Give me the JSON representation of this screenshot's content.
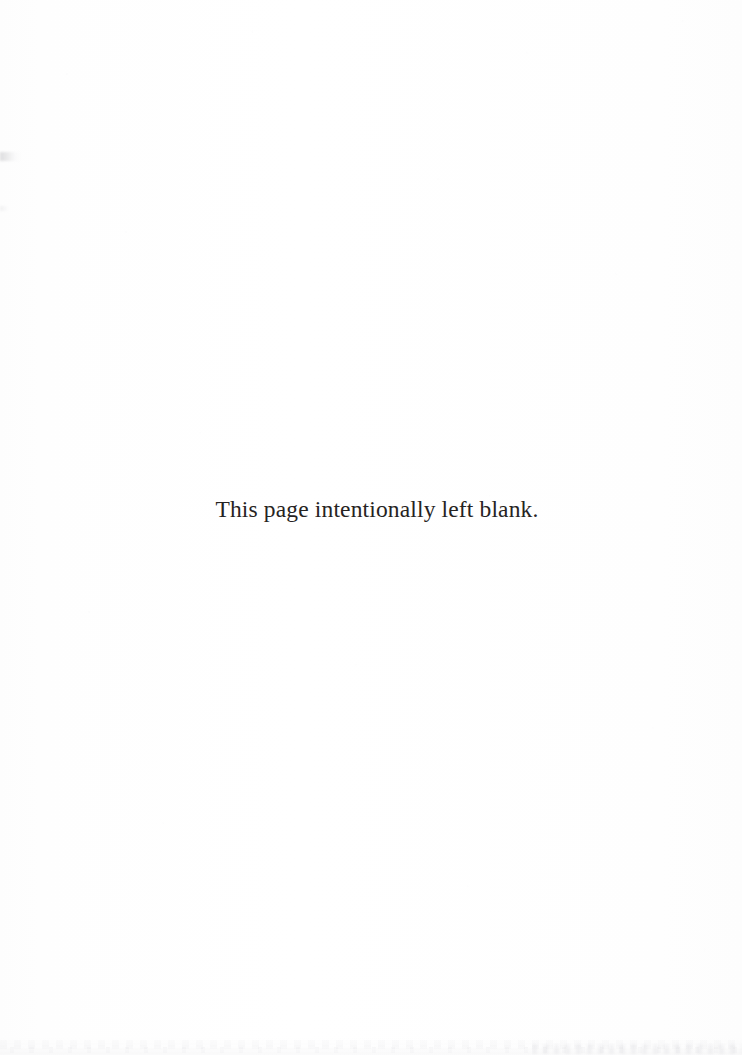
{
  "page": {
    "background_color": "#fefefe",
    "width": 742,
    "height": 1055
  },
  "content": {
    "notice_text": "This page intentionally left blank.",
    "text_color": "#262322"
  },
  "artifacts": {
    "left_edge_smudge_label": "",
    "bottom_ghost_band_label": ""
  }
}
